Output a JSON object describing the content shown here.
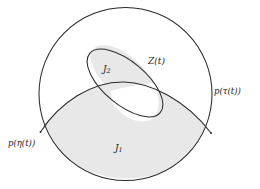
{
  "figure": {
    "type": "mathematical-set-diagram",
    "background_color": "#ffffff",
    "stroke_color": "#2b2b2b",
    "shaded_fill_color": "#e8e8e8",
    "unshaded_fill_color": "#ffffff"
  },
  "labels": {
    "z_of_t": "Z(t)",
    "p_tau_of_t": "p(τ(t))",
    "p_eta_of_t": "p(η(t))",
    "j_one_base": "J",
    "j_one_sub": "1",
    "j_two_base": "J",
    "j_two_sub": "2"
  },
  "shapes": {
    "outer_circle": {
      "name": "outer-boundary-circle",
      "cx": 125.5,
      "cy": 94,
      "r": 86.5
    },
    "region_j1": {
      "name": "region-j1-shaded",
      "filled": true
    },
    "region_j2": {
      "name": "region-j2-shaded",
      "filled": true
    },
    "ellipse_hole": {
      "name": "ellipse-lower-lobe-unshaded",
      "filled": false
    }
  }
}
